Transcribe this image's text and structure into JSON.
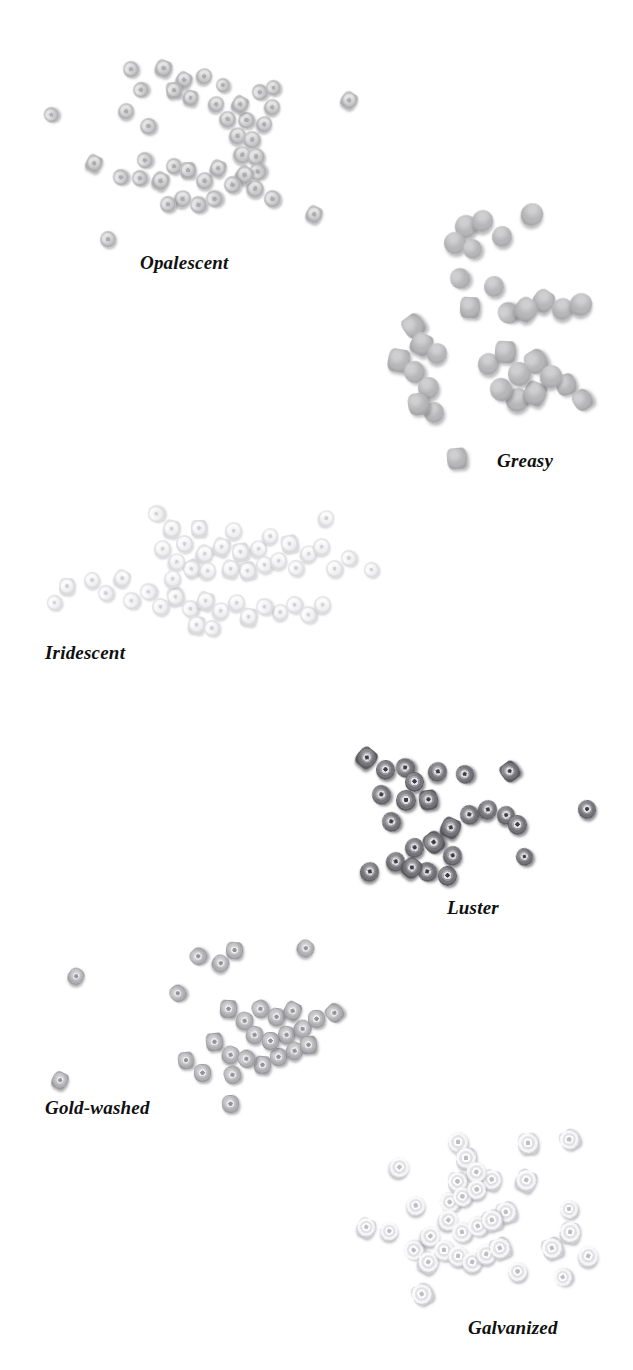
{
  "plate": {
    "kind": "photographic-reference-plate",
    "subject": "seed bead surface finishes",
    "background_color": "#ffffff",
    "label_color": "#101010",
    "width": 633,
    "height": 1370
  },
  "groups": [
    {
      "id": "opalescent",
      "label": "Opalescent",
      "label_x": 140,
      "label_y": 252,
      "label_size": 19,
      "finish": "f-opalescent",
      "bead_count": 44,
      "bead_size_range": [
        13,
        20
      ],
      "color_note": "#c9c9cb",
      "beads": [
        [
          44,
          107,
          15,
          16
        ],
        [
          123,
          61,
          16,
          17
        ],
        [
          133,
          82,
          16,
          16
        ],
        [
          118,
          103,
          16,
          17
        ],
        [
          140,
          118,
          17,
          17
        ],
        [
          155,
          60,
          17,
          17
        ],
        [
          166,
          82,
          16,
          17
        ],
        [
          176,
          72,
          16,
          16
        ],
        [
          183,
          90,
          15,
          16
        ],
        [
          196,
          68,
          16,
          17
        ],
        [
          216,
          78,
          14,
          15
        ],
        [
          208,
          96,
          16,
          17
        ],
        [
          219,
          111,
          17,
          17
        ],
        [
          232,
          96,
          16,
          17
        ],
        [
          238,
          112,
          17,
          17
        ],
        [
          229,
          127,
          17,
          18
        ],
        [
          243,
          131,
          18,
          18
        ],
        [
          233,
          146,
          18,
          18
        ],
        [
          247,
          148,
          18,
          18
        ],
        [
          249,
          163,
          18,
          18
        ],
        [
          236,
          166,
          17,
          18
        ],
        [
          256,
          116,
          16,
          17
        ],
        [
          264,
          99,
          16,
          17
        ],
        [
          252,
          84,
          16,
          17
        ],
        [
          266,
          80,
          15,
          16
        ],
        [
          86,
          155,
          16,
          17
        ],
        [
          113,
          169,
          16,
          17
        ],
        [
          137,
          152,
          16,
          17
        ],
        [
          132,
          170,
          16,
          17
        ],
        [
          152,
          172,
          17,
          18
        ],
        [
          166,
          158,
          16,
          17
        ],
        [
          180,
          162,
          16,
          17
        ],
        [
          196,
          172,
          17,
          18
        ],
        [
          210,
          160,
          16,
          17
        ],
        [
          224,
          176,
          17,
          18
        ],
        [
          174,
          190,
          17,
          18
        ],
        [
          190,
          196,
          17,
          18
        ],
        [
          206,
          190,
          17,
          18
        ],
        [
          246,
          180,
          18,
          18
        ],
        [
          264,
          190,
          17,
          18
        ],
        [
          306,
          206,
          16,
          17
        ],
        [
          100,
          231,
          16,
          17
        ],
        [
          341,
          92,
          16,
          17
        ],
        [
          160,
          196,
          16,
          17
        ]
      ]
    },
    {
      "id": "greasy",
      "label": "Greasy",
      "label_x": 497,
      "label_y": 450,
      "label_size": 19,
      "finish": "f-greasy",
      "bead_count": 27,
      "bead_size_range": [
        17,
        25
      ],
      "color_note": "#ababae",
      "beads": [
        [
          455,
          215,
          22,
          23
        ],
        [
          472,
          210,
          21,
          22
        ],
        [
          492,
          226,
          20,
          21
        ],
        [
          444,
          232,
          22,
          22
        ],
        [
          463,
          239,
          19,
          20
        ],
        [
          521,
          203,
          22,
          23
        ],
        [
          450,
          268,
          20,
          21
        ],
        [
          484,
          276,
          20,
          21
        ],
        [
          460,
          297,
          20,
          21
        ],
        [
          403,
          315,
          21,
          22
        ],
        [
          411,
          333,
          21,
          22
        ],
        [
          427,
          343,
          20,
          21
        ],
        [
          498,
          302,
          21,
          22
        ],
        [
          515,
          298,
          22,
          23
        ],
        [
          533,
          290,
          21,
          22
        ],
        [
          552,
          298,
          21,
          22
        ],
        [
          570,
          293,
          22,
          23
        ],
        [
          388,
          349,
          22,
          23
        ],
        [
          404,
          361,
          21,
          22
        ],
        [
          418,
          377,
          21,
          22
        ],
        [
          408,
          393,
          21,
          22
        ],
        [
          424,
          402,
          20,
          21
        ],
        [
          478,
          353,
          21,
          22
        ],
        [
          495,
          341,
          21,
          22
        ],
        [
          508,
          362,
          23,
          24
        ],
        [
          525,
          350,
          22,
          23
        ],
        [
          540,
          365,
          22,
          23
        ],
        [
          490,
          378,
          22,
          23
        ],
        [
          506,
          388,
          23,
          24
        ],
        [
          524,
          382,
          22,
          23
        ],
        [
          556,
          374,
          20,
          21
        ],
        [
          573,
          390,
          19,
          20
        ],
        [
          447,
          448,
          20,
          21
        ]
      ]
    },
    {
      "id": "iridescent",
      "label": "Iridescent",
      "label_x": 45,
      "label_y": 642,
      "label_size": 19,
      "finish": "f-iridescent",
      "bead_count": 48,
      "bead_size_range": [
        14,
        20
      ],
      "color_note": "#ededef",
      "beads": [
        [
          148,
          505,
          17,
          18
        ],
        [
          163,
          520,
          17,
          18
        ],
        [
          176,
          535,
          17,
          18
        ],
        [
          154,
          540,
          17,
          18
        ],
        [
          168,
          553,
          17,
          18
        ],
        [
          164,
          570,
          17,
          18
        ],
        [
          191,
          520,
          16,
          17
        ],
        [
          196,
          545,
          17,
          18
        ],
        [
          183,
          560,
          17,
          18
        ],
        [
          199,
          562,
          17,
          18
        ],
        [
          213,
          538,
          17,
          18
        ],
        [
          225,
          522,
          17,
          18
        ],
        [
          232,
          543,
          17,
          18
        ],
        [
          222,
          560,
          17,
          18
        ],
        [
          239,
          562,
          17,
          18
        ],
        [
          250,
          540,
          17,
          18
        ],
        [
          262,
          528,
          16,
          17
        ],
        [
          256,
          556,
          17,
          18
        ],
        [
          270,
          552,
          17,
          18
        ],
        [
          281,
          535,
          17,
          18
        ],
        [
          288,
          560,
          16,
          17
        ],
        [
          300,
          545,
          17,
          18
        ],
        [
          313,
          538,
          17,
          18
        ],
        [
          318,
          510,
          16,
          17
        ],
        [
          326,
          560,
          17,
          18
        ],
        [
          341,
          550,
          16,
          17
        ],
        [
          364,
          562,
          15,
          16
        ],
        [
          59,
          578,
          16,
          17
        ],
        [
          47,
          595,
          15,
          16
        ],
        [
          84,
          572,
          16,
          17
        ],
        [
          98,
          585,
          16,
          17
        ],
        [
          114,
          570,
          16,
          17
        ],
        [
          123,
          592,
          17,
          18
        ],
        [
          140,
          583,
          17,
          18
        ],
        [
          152,
          598,
          17,
          18
        ],
        [
          167,
          588,
          17,
          18
        ],
        [
          182,
          600,
          17,
          18
        ],
        [
          197,
          592,
          17,
          18
        ],
        [
          212,
          602,
          17,
          18
        ],
        [
          228,
          594,
          17,
          18
        ],
        [
          240,
          608,
          17,
          18
        ],
        [
          256,
          598,
          17,
          18
        ],
        [
          272,
          604,
          16,
          17
        ],
        [
          286,
          596,
          17,
          18
        ],
        [
          300,
          606,
          17,
          18
        ],
        [
          314,
          596,
          17,
          18
        ],
        [
          188,
          616,
          17,
          18
        ],
        [
          204,
          620,
          16,
          17
        ]
      ]
    },
    {
      "id": "luster",
      "label": "Luster",
      "label_x": 447,
      "label_y": 897,
      "label_size": 19,
      "finish": "f-luster",
      "bead_count": 26,
      "bead_size_range": [
        17,
        23
      ],
      "color_note": "#7a7a80",
      "beads": [
        [
          357,
          748,
          19,
          20
        ],
        [
          376,
          760,
          19,
          20
        ],
        [
          396,
          758,
          19,
          20
        ],
        [
          428,
          762,
          19,
          20
        ],
        [
          405,
          772,
          19,
          20
        ],
        [
          372,
          785,
          19,
          20
        ],
        [
          396,
          790,
          20,
          21
        ],
        [
          419,
          790,
          19,
          20
        ],
        [
          456,
          765,
          18,
          19
        ],
        [
          501,
          762,
          18,
          19
        ],
        [
          460,
          805,
          19,
          20
        ],
        [
          478,
          800,
          19,
          20
        ],
        [
          497,
          806,
          18,
          19
        ],
        [
          508,
          815,
          19,
          20
        ],
        [
          382,
          812,
          19,
          20
        ],
        [
          441,
          818,
          19,
          20
        ],
        [
          405,
          838,
          19,
          20
        ],
        [
          424,
          832,
          20,
          21
        ],
        [
          443,
          846,
          19,
          20
        ],
        [
          386,
          852,
          19,
          20
        ],
        [
          402,
          858,
          19,
          20
        ],
        [
          418,
          862,
          19,
          20
        ],
        [
          438,
          866,
          19,
          20
        ],
        [
          578,
          800,
          18,
          19
        ],
        [
          516,
          848,
          17,
          18
        ],
        [
          360,
          862,
          19,
          20
        ]
      ]
    },
    {
      "id": "gold-washed",
      "label": "Gold-washed",
      "label_x": 45,
      "label_y": 1097,
      "label_size": 19,
      "finish": "f-goldwashed",
      "bead_count": 29,
      "bead_size_range": [
        15,
        21
      ],
      "color_note": "#c2c2c6",
      "beads": [
        [
          190,
          948,
          17,
          17
        ],
        [
          212,
          955,
          17,
          17
        ],
        [
          226,
          942,
          17,
          17
        ],
        [
          297,
          940,
          17,
          17
        ],
        [
          170,
          985,
          16,
          17
        ],
        [
          68,
          968,
          16,
          17
        ],
        [
          52,
          1072,
          16,
          17
        ],
        [
          220,
          1000,
          17,
          18
        ],
        [
          236,
          1012,
          17,
          18
        ],
        [
          252,
          1000,
          17,
          18
        ],
        [
          268,
          1008,
          17,
          18
        ],
        [
          284,
          1002,
          17,
          18
        ],
        [
          246,
          1026,
          17,
          18
        ],
        [
          262,
          1032,
          17,
          18
        ],
        [
          278,
          1026,
          17,
          18
        ],
        [
          294,
          1020,
          17,
          18
        ],
        [
          308,
          1010,
          17,
          18
        ],
        [
          326,
          1004,
          17,
          18
        ],
        [
          206,
          1033,
          17,
          18
        ],
        [
          222,
          1046,
          17,
          18
        ],
        [
          238,
          1050,
          17,
          18
        ],
        [
          254,
          1056,
          17,
          18
        ],
        [
          270,
          1048,
          17,
          18
        ],
        [
          286,
          1042,
          17,
          18
        ],
        [
          300,
          1036,
          17,
          18
        ],
        [
          178,
          1052,
          16,
          17
        ],
        [
          194,
          1064,
          17,
          18
        ],
        [
          224,
          1066,
          17,
          18
        ],
        [
          222,
          1095,
          17,
          18
        ]
      ]
    },
    {
      "id": "galvanized",
      "label": "Galvanized",
      "label_x": 468,
      "label_y": 1317,
      "label_size": 19,
      "finish": "f-galvanized",
      "bead_count": 34,
      "bead_size_range": [
        16,
        23
      ],
      "color_note": "#e9e9ed",
      "beads": [
        [
          448,
          1132,
          20,
          21
        ],
        [
          456,
          1148,
          20,
          21
        ],
        [
          466,
          1162,
          20,
          21
        ],
        [
          389,
          1157,
          20,
          21
        ],
        [
          448,
          1172,
          19,
          20
        ],
        [
          453,
          1187,
          19,
          20
        ],
        [
          467,
          1180,
          19,
          20
        ],
        [
          482,
          1170,
          19,
          20
        ],
        [
          440,
          1192,
          20,
          21
        ],
        [
          406,
          1196,
          19,
          20
        ],
        [
          438,
          1210,
          20,
          21
        ],
        [
          452,
          1222,
          20,
          21
        ],
        [
          468,
          1216,
          20,
          21
        ],
        [
          482,
          1210,
          20,
          21
        ],
        [
          496,
          1202,
          20,
          21
        ],
        [
          420,
          1226,
          20,
          21
        ],
        [
          434,
          1240,
          20,
          21
        ],
        [
          448,
          1246,
          20,
          21
        ],
        [
          462,
          1252,
          20,
          21
        ],
        [
          476,
          1244,
          20,
          21
        ],
        [
          490,
          1238,
          20,
          21
        ],
        [
          404,
          1240,
          20,
          21
        ],
        [
          418,
          1252,
          20,
          21
        ],
        [
          357,
          1218,
          18,
          19
        ],
        [
          380,
          1222,
          18,
          19
        ],
        [
          412,
          1284,
          20,
          21
        ],
        [
          518,
          1133,
          20,
          21
        ],
        [
          560,
          1130,
          19,
          20
        ],
        [
          516,
          1170,
          20,
          21
        ],
        [
          560,
          1200,
          18,
          19
        ],
        [
          560,
          1222,
          20,
          21
        ],
        [
          542,
          1238,
          20,
          21
        ],
        [
          578,
          1246,
          20,
          21
        ],
        [
          554,
          1268,
          18,
          19
        ],
        [
          508,
          1262,
          19,
          20
        ]
      ]
    }
  ]
}
